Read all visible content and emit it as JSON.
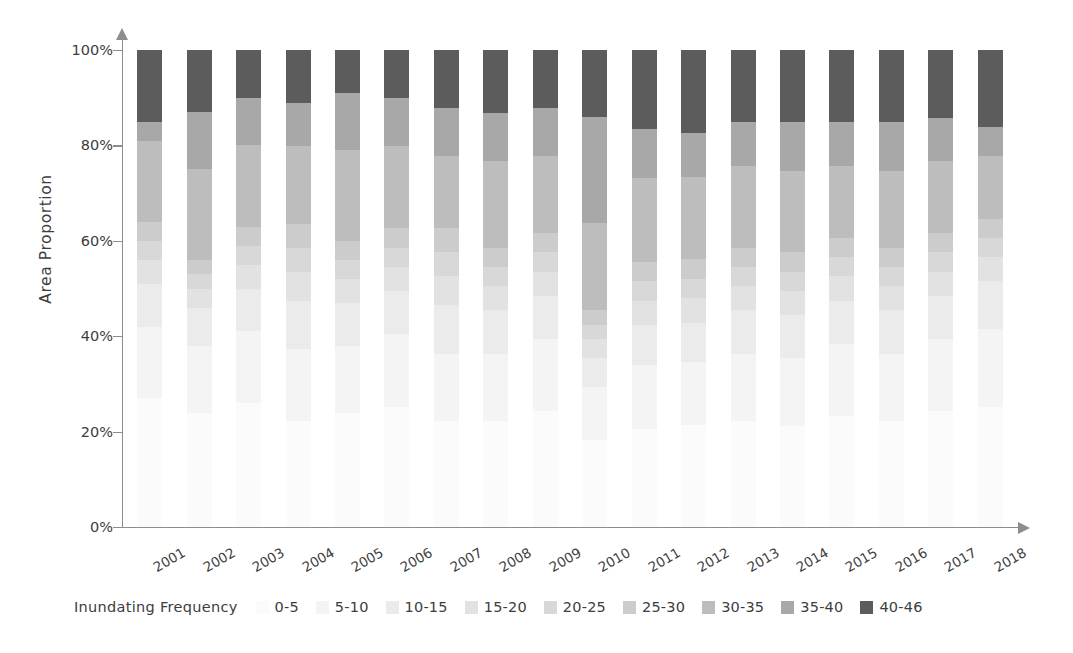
{
  "chart_data": {
    "type": "bar",
    "subtype": "100% stacked bar",
    "title": "",
    "xlabel": "",
    "ylabel": "Area Proportion",
    "ylim": [
      0,
      100
    ],
    "ytick_labels": [
      "0%",
      "20%",
      "40%",
      "60%",
      "80%",
      "100%"
    ],
    "ytick_values": [
      0,
      20,
      40,
      60,
      80,
      100
    ],
    "grid": false,
    "legend_position": "bottom",
    "legend_title": "Inundating  Frequency",
    "categories": [
      "2001",
      "2002",
      "2003",
      "2004",
      "2005",
      "2006",
      "2007",
      "2008",
      "2009",
      "2010",
      "2011",
      "2012",
      "2013",
      "2014",
      "2015",
      "2016",
      "2017",
      "2018"
    ],
    "series": [
      {
        "name": "0-5",
        "color": "#fbfbfb",
        "values": [
          27,
          24,
          26,
          22,
          24,
          25,
          22,
          22,
          24,
          18,
          20,
          21,
          22,
          21,
          23,
          22,
          24,
          25
        ]
      },
      {
        "name": "5-10",
        "color": "#f4f4f4",
        "values": [
          15,
          14,
          15,
          15,
          14,
          15,
          14,
          14,
          15,
          11,
          13,
          13,
          14,
          14,
          15,
          14,
          15,
          16
        ]
      },
      {
        "name": "10-15",
        "color": "#ebebeb",
        "values": [
          9,
          8,
          9,
          10,
          9,
          9,
          10,
          9,
          9,
          6,
          8,
          8,
          9,
          9,
          9,
          9,
          9,
          10
        ]
      },
      {
        "name": "15-20",
        "color": "#e2e2e2",
        "values": [
          5,
          4,
          5,
          6,
          5,
          5,
          6,
          5,
          5,
          4,
          5,
          5,
          5,
          5,
          5,
          5,
          5,
          5
        ]
      },
      {
        "name": "20-25",
        "color": "#d8d8d8",
        "values": [
          4,
          3,
          4,
          5,
          4,
          4,
          5,
          4,
          4,
          3,
          4,
          4,
          4,
          4,
          4,
          4,
          4,
          4
        ]
      },
      {
        "name": "25-30",
        "color": "#cccccc",
        "values": [
          4,
          3,
          4,
          5,
          4,
          4,
          5,
          4,
          4,
          3,
          4,
          4,
          4,
          4,
          4,
          4,
          4,
          4
        ]
      },
      {
        "name": "30-35",
        "color": "#bdbdbd",
        "values": [
          17,
          19,
          17,
          16,
          19,
          17,
          15,
          18,
          16,
          18,
          17,
          17,
          17,
          17,
          15,
          16,
          15,
          13
        ]
      },
      {
        "name": "35-40",
        "color": "#a8a8a8",
        "values": [
          4,
          12,
          10,
          9,
          12,
          10,
          10,
          10,
          10,
          22,
          10,
          9,
          9,
          10,
          9,
          10,
          9,
          6
        ]
      },
      {
        "name": "40-46",
        "color": "#5c5c5c",
        "values": [
          15,
          13,
          10,
          11,
          9,
          10,
          12,
          13,
          12,
          14,
          16,
          17,
          15,
          15,
          15,
          15,
          14,
          16
        ]
      }
    ]
  },
  "axis": {
    "y_title": "Area Proportion"
  },
  "legend": {
    "title": "Inundating  Frequency",
    "items": [
      {
        "label": "0-5",
        "color": "#fbfbfb"
      },
      {
        "label": "5-10",
        "color": "#f4f4f4"
      },
      {
        "label": "10-15",
        "color": "#ebebeb"
      },
      {
        "label": "15-20",
        "color": "#e2e2e2"
      },
      {
        "label": "20-25",
        "color": "#d8d8d8"
      },
      {
        "label": "25-30",
        "color": "#cccccc"
      },
      {
        "label": "30-35",
        "color": "#bdbdbd"
      },
      {
        "label": "35-40",
        "color": "#a8a8a8"
      },
      {
        "label": "40-46",
        "color": "#5c5c5c"
      }
    ]
  },
  "colors": {
    "axis": "#8d8d8d",
    "text": "#3d3d3d",
    "background": "#ffffff"
  }
}
